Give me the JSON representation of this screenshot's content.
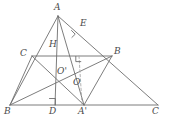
{
  "figure": {
    "kind": "geometry-diagram",
    "stroke_color": "#6e6e6e",
    "label_color": "#4a4a4a",
    "background_color": "#ffffff",
    "dashed_color": "#9a9a9a"
  },
  "labels": {
    "A": "A",
    "E": "E",
    "H": "H",
    "C_left": "C",
    "B_right": "B",
    "O_prime": "O'",
    "O": "O",
    "B_bottom_left": "B",
    "D": "D",
    "A_prime": "A'",
    "C_bottom_right": "C"
  },
  "points": [
    {
      "name": "A",
      "label": "A",
      "x": 58,
      "y": 16,
      "label_x": 54,
      "label_y": 4
    },
    {
      "name": "E",
      "label": "E",
      "x": 79,
      "y": 32,
      "label_x": 80,
      "label_y": 20
    },
    {
      "name": "H",
      "label": "H",
      "x": 56,
      "y": 48,
      "label_x": 50,
      "label_y": 42
    },
    {
      "name": "C",
      "label": "C",
      "x": 32,
      "y": 56,
      "label_x": 21,
      "label_y": 50
    },
    {
      "name": "B2",
      "label": "B",
      "x": 112,
      "y": 56,
      "label_x": 114,
      "label_y": 48
    },
    {
      "name": "O2",
      "label": "O'",
      "x": 64,
      "y": 76,
      "label_x": 58,
      "label_y": 68
    },
    {
      "name": "O",
      "label": "O",
      "x": 79,
      "y": 86,
      "label_x": 74,
      "label_y": 79
    },
    {
      "name": "B",
      "label": "B",
      "x": 10,
      "y": 105,
      "label_x": 5,
      "label_y": 108
    },
    {
      "name": "D",
      "label": "D",
      "x": 55,
      "y": 105,
      "label_x": 50,
      "label_y": 108
    },
    {
      "name": "A1",
      "label": "A'",
      "x": 84,
      "y": 105,
      "label_x": 79,
      "label_y": 108
    },
    {
      "name": "C2",
      "label": "C",
      "x": 158,
      "y": 105,
      "label_x": 153,
      "label_y": 108
    }
  ],
  "segments": [
    {
      "name": "base-B-C",
      "from": "B",
      "to": "C2",
      "style": "solid"
    },
    {
      "name": "side-B-A",
      "from": "B",
      "to": "A",
      "style": "solid"
    },
    {
      "name": "side-A-C",
      "from": "A",
      "to": "C2",
      "style": "solid"
    },
    {
      "name": "altitude-A-D",
      "from": "A",
      "to": "D",
      "style": "solid"
    },
    {
      "name": "midline-C-B",
      "from": "C",
      "to": "B2",
      "style": "solid"
    },
    {
      "name": "cevian-B-B2",
      "from": "B",
      "to": "B2",
      "style": "solid"
    },
    {
      "name": "cevian-C-A1",
      "from": "C",
      "to": "A1",
      "style": "solid"
    },
    {
      "name": "segment-A-A1",
      "from": "A",
      "to": "A1",
      "style": "solid"
    },
    {
      "name": "segment-A1-B2",
      "from": "A1",
      "to": "B2",
      "style": "solid"
    },
    {
      "name": "perp-dashed-A1",
      "from": "A1",
      "to": "P",
      "style": "dashed"
    }
  ],
  "right_angles": [
    {
      "name": "right-angle-at-E",
      "x": 74,
      "y": 33
    },
    {
      "name": "right-angle-at-D",
      "x": 55,
      "y": 98
    },
    {
      "name": "right-angle-on-midline",
      "x": 79,
      "y": 56
    }
  ]
}
